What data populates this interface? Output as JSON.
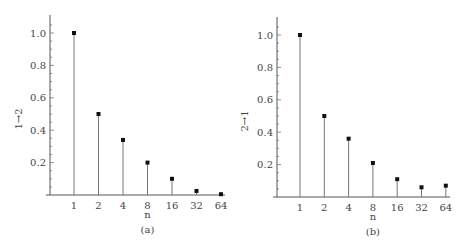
{
  "chart_data": [
    {
      "type": "stem",
      "panel_label": "(a)",
      "xlabel": "n",
      "ylabel": "1→2",
      "categories": [
        "1",
        "2",
        "4",
        "8",
        "16",
        "32",
        "64"
      ],
      "values": [
        1.0,
        0.5,
        0.34,
        0.2,
        0.1,
        0.025,
        0.005
      ],
      "y_ticks": [
        "0.2",
        "0.4",
        "0.6",
        "0.8",
        "1.0"
      ],
      "ylim": [
        0,
        1.1
      ],
      "grid": false
    },
    {
      "type": "stem",
      "panel_label": "(b)",
      "xlabel": "n",
      "ylabel": "2→1",
      "categories": [
        "1",
        "2",
        "4",
        "8",
        "16",
        "32",
        "64"
      ],
      "values": [
        1.0,
        0.5,
        0.36,
        0.21,
        0.11,
        0.06,
        0.07
      ],
      "y_ticks": [
        "0.2",
        "0.4",
        "0.6",
        "0.8",
        "1.0"
      ],
      "ylim": [
        0,
        1.1
      ],
      "grid": false
    }
  ]
}
